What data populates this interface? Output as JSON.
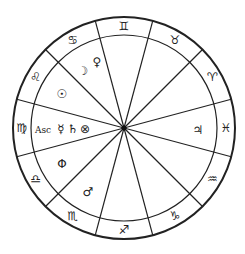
{
  "chart": {
    "center": [
      124,
      128
    ],
    "outer_radius": 111,
    "inner_radius": 93,
    "line_color": "#222222",
    "background": "#ffffff",
    "divider_angles_deg": [
      15,
      45,
      75,
      105,
      135,
      165,
      195,
      225,
      255,
      285,
      315,
      345
    ],
    "signs": [
      {
        "name": "Gemini",
        "glyph": "♊",
        "angle": 90
      },
      {
        "name": "Taurus",
        "glyph": "♉",
        "angle": 60
      },
      {
        "name": "Aries",
        "glyph": "♈",
        "angle": 30
      },
      {
        "name": "Pisces",
        "glyph": "♓",
        "angle": 0
      },
      {
        "name": "Aquarius",
        "glyph": "♒",
        "angle": -30
      },
      {
        "name": "Capricorn",
        "glyph": "♑",
        "angle": -60
      },
      {
        "name": "Sagittarius",
        "glyph": "♐",
        "angle": -90
      },
      {
        "name": "Scorpio",
        "glyph": "♏",
        "angle": -120
      },
      {
        "name": "Libra",
        "glyph": "♎",
        "angle": -150
      },
      {
        "name": "Virgo",
        "glyph": "♍",
        "angle": 180
      },
      {
        "name": "Leo",
        "glyph": "♌",
        "angle": 150
      },
      {
        "name": "Cancer",
        "glyph": "♋",
        "angle": 120
      }
    ],
    "planets": [
      {
        "name": "Moon",
        "glyph": "☽",
        "x": 83,
        "y": 71
      },
      {
        "name": "Venus",
        "glyph": "♀",
        "x": 97,
        "y": 62
      },
      {
        "name": "Sun",
        "glyph": "☉",
        "x": 62,
        "y": 94
      },
      {
        "name": "Ascendant",
        "glyph": "Asc",
        "x": 43,
        "y": 130
      },
      {
        "name": "Mercury",
        "glyph": "☿",
        "x": 61,
        "y": 129
      },
      {
        "name": "Saturn",
        "glyph": "♄",
        "x": 73,
        "y": 129
      },
      {
        "name": "Part of Fortune",
        "glyph": "⊗",
        "x": 85,
        "y": 129
      },
      {
        "name": "Phi",
        "glyph": "Φ",
        "x": 62,
        "y": 164
      },
      {
        "name": "Mars",
        "glyph": "♂",
        "x": 88,
        "y": 192
      },
      {
        "name": "Jupiter",
        "glyph": "♃",
        "x": 198,
        "y": 130
      }
    ]
  }
}
